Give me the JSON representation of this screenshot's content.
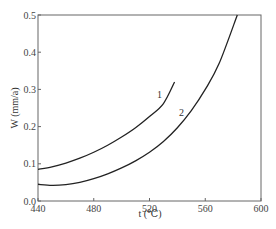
{
  "chart_data": {
    "type": "line",
    "title": "",
    "xlabel": "t (℃)",
    "ylabel": "W (mm/a)",
    "xlim": [
      440,
      600
    ],
    "ylim": [
      0.0,
      0.5
    ],
    "xticks": [
      440,
      480,
      520,
      560,
      600
    ],
    "yticks": [
      0.0,
      0.1,
      0.2,
      0.3,
      0.4,
      0.5
    ],
    "xtick_labels": [
      "440",
      "480",
      "520",
      "560",
      "600"
    ],
    "ytick_labels": [
      "0.0",
      "0.1",
      "0.2",
      "0.3",
      "0.4",
      "0.5"
    ],
    "grid": false,
    "legend": "none (curves labeled inline)",
    "series": [
      {
        "name": "1",
        "x": [
          440,
          450,
          460,
          470,
          480,
          490,
          500,
          510,
          520,
          530,
          538
        ],
        "y": [
          0.085,
          0.092,
          0.102,
          0.115,
          0.131,
          0.15,
          0.172,
          0.197,
          0.227,
          0.262,
          0.32
        ]
      },
      {
        "name": "2",
        "x": [
          440,
          450,
          460,
          470,
          480,
          490,
          500,
          510,
          520,
          530,
          540,
          550,
          560,
          570,
          583
        ],
        "y": [
          0.045,
          0.042,
          0.044,
          0.05,
          0.06,
          0.073,
          0.089,
          0.108,
          0.131,
          0.16,
          0.197,
          0.243,
          0.3,
          0.37,
          0.5
        ]
      }
    ]
  },
  "labels": {
    "x_axis": "t (℃)",
    "y_axis": "W (mm/a)",
    "curve1": "1",
    "curve2": "2"
  }
}
